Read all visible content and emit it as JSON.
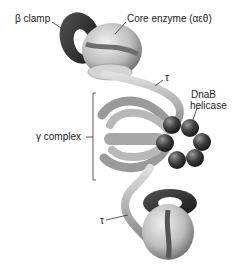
{
  "diagram": {
    "labels": {
      "beta_clamp": "β clamp",
      "core_enzyme": "Core enzyme (αεθ)",
      "tau_top": "τ",
      "dnab_line1": "DnaB",
      "dnab_line2": "helicase",
      "gamma_complex": "γ complex",
      "tau_bottom": "τ"
    },
    "colors": {
      "clamp": "#2a2a2a",
      "core": "#c8c8c8",
      "core_shadow": "#6e6e6e",
      "arms": "#b4b4b4",
      "helicase": "#444444",
      "background": "#ffffff"
    }
  }
}
